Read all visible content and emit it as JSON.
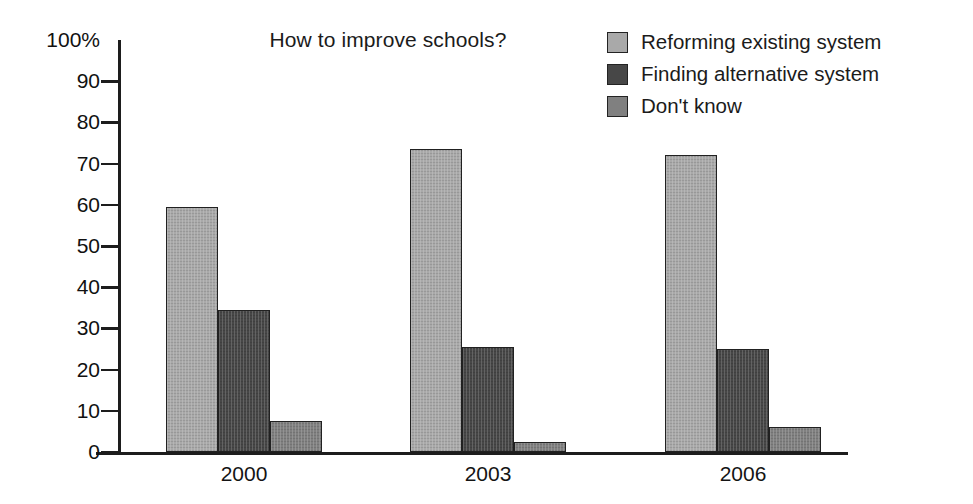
{
  "chart_data": {
    "type": "bar",
    "title": "How to improve schools?",
    "xlabel": "",
    "ylabel": "",
    "categories": [
      "2000",
      "2003",
      "2006"
    ],
    "series": [
      {
        "name": "Reforming existing system",
        "values": [
          59.5,
          73.5,
          72
        ],
        "color": "#a9a9a9"
      },
      {
        "name": "Finding alternative system",
        "values": [
          34.5,
          25.5,
          25
        ],
        "color": "#474747"
      },
      {
        "name": "Don't know",
        "values": [
          7.5,
          2.5,
          6
        ],
        "color": "#808080"
      }
    ],
    "ylim": [
      0,
      100
    ],
    "yticks": [
      100,
      90,
      80,
      70,
      60,
      50,
      40,
      30,
      20,
      10,
      0
    ],
    "ytick_labels": [
      "100%",
      "90",
      "80",
      "70",
      "60",
      "50",
      "40",
      "30",
      "20",
      "10",
      "0"
    ],
    "grid": false,
    "legend_position": "top-right",
    "axis_color": "#1d1d1d",
    "background": "#ffffff"
  },
  "legend": {
    "items": [
      {
        "label": "Reforming existing system",
        "color": "#a9a9a9"
      },
      {
        "label": "Finding alternative system",
        "color": "#474747"
      },
      {
        "label": "Don't know",
        "color": "#808080"
      }
    ]
  }
}
